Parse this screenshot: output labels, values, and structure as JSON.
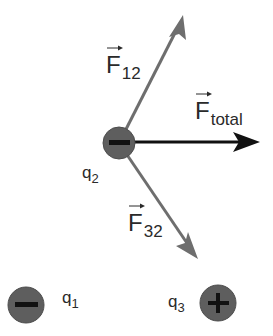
{
  "diagram": {
    "type": "force-vector-diagram",
    "charges": [
      {
        "id": "q2",
        "label": "q",
        "subscript": "2",
        "sign": "−",
        "cx": 119,
        "cy": 143,
        "r": 15
      },
      {
        "id": "q1",
        "label": "q",
        "subscript": "1",
        "sign": "−",
        "cx": 26,
        "cy": 305,
        "r": 18
      },
      {
        "id": "q3",
        "label": "q",
        "subscript": "3",
        "sign": "+",
        "cx": 218,
        "cy": 303,
        "r": 18
      }
    ],
    "vectors": [
      {
        "id": "F12",
        "label": "F",
        "subscript": "12",
        "from": [
          119,
          143
        ],
        "to": [
          183,
          17
        ],
        "color": "#6e6e6e"
      },
      {
        "id": "Ftotal",
        "label": "F",
        "subscript": "total",
        "from": [
          119,
          143
        ],
        "to": [
          259,
          141
        ],
        "color": "#111111"
      },
      {
        "id": "F32",
        "label": "F",
        "subscript": "32",
        "from": [
          119,
          143
        ],
        "to": [
          197,
          258
        ],
        "color": "#6e6e6e"
      }
    ],
    "colors": {
      "charge_fill": "#5e5e5e",
      "charge_stroke": "#4a4a4a",
      "sign_color": "#111111",
      "text": "#2a2a2a",
      "background": "#ffffff"
    }
  },
  "labels": {
    "f12": {
      "main": "F",
      "sub": "12"
    },
    "ftotal": {
      "main": "F",
      "sub": "total"
    },
    "f32": {
      "main": "F",
      "sub": "32"
    },
    "q1": {
      "main": "q",
      "sub": "1"
    },
    "q2": {
      "main": "q",
      "sub": "2"
    },
    "q3": {
      "main": "q",
      "sub": "3"
    }
  }
}
